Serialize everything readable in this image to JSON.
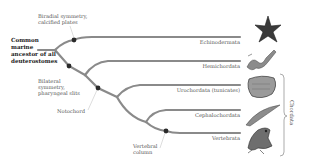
{
  "diagram": {
    "type": "phylogenetic-tree",
    "root": {
      "label_lines": [
        "Common",
        "marine",
        "ancestor of all",
        "deuterostomes"
      ]
    },
    "characters": [
      {
        "id": "radial",
        "label_lines": [
          "Biradial symmetry,",
          "calcified plates"
        ]
      },
      {
        "id": "bilateral",
        "label_lines": [
          "Bilateral",
          "symmetry,",
          "pharyngeal slits"
        ]
      },
      {
        "id": "notochord",
        "label_lines": [
          "Notochord"
        ]
      },
      {
        "id": "vertebral",
        "label_lines": [
          "Vertebral",
          "column"
        ]
      }
    ],
    "taxa": [
      {
        "name": "Echinodermata",
        "image": "starfish"
      },
      {
        "name": "Hemichordata",
        "image": "acorn-worm"
      },
      {
        "name": "Urochordata (tunicates)",
        "image": "tunicate"
      },
      {
        "name": "Cephalochordata",
        "image": "lancelet"
      },
      {
        "name": "Vertebrata",
        "image": "frog"
      }
    ],
    "group_bracket": {
      "label": "Chordata",
      "spans": [
        "Urochordata (tunicates)",
        "Cephalochordata",
        "Vertebrata"
      ]
    },
    "colors": {
      "branch": "#8a8a8a",
      "node_dot": "#2a2a2a",
      "text": "#555555",
      "root_text": "#222222"
    }
  }
}
